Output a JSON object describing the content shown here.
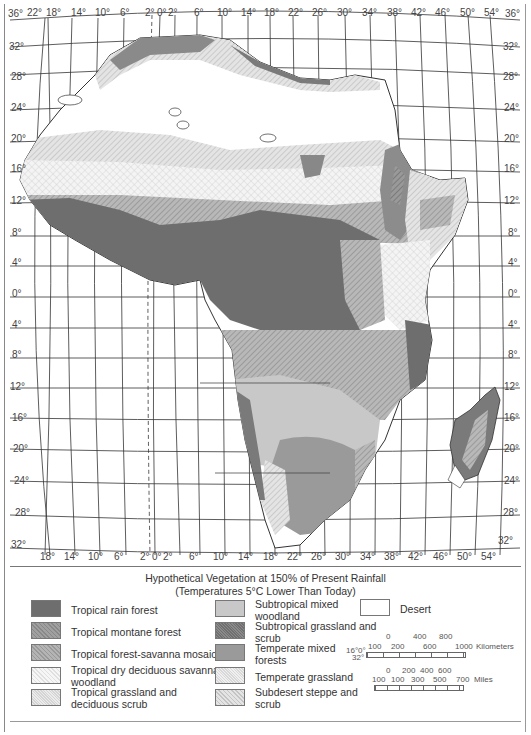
{
  "map": {
    "title": "Hypothetical Vegetation at 150% of Present Rainfall",
    "subtitle": "(Temperatures 5°C Lower Than Today)",
    "top_longitude_labels": [
      "22°",
      "18°",
      "14°",
      "10°",
      "6°",
      "2°",
      "0°",
      "2°",
      "6°",
      "10°",
      "14°",
      "18°",
      "22°",
      "26°",
      "30°",
      "34°",
      "38°",
      "42°",
      "46°",
      "50°",
      "54°"
    ],
    "bottom_longitude_labels": [
      "18°",
      "14°",
      "10°",
      "6°",
      "2°",
      "0°",
      "2°",
      "6°",
      "10°",
      "14°",
      "18°",
      "22°",
      "26°",
      "30°",
      "34°",
      "38°",
      "42°",
      "46°",
      "50°",
      "54°"
    ],
    "left_latitude_labels": [
      "36°",
      "32°",
      "28°",
      "24°",
      "20°",
      "16°",
      "12°",
      "8°",
      "4°",
      "0°",
      "4°",
      "8°",
      "12°",
      "16°",
      "20°",
      "24°",
      "28°",
      "32°"
    ],
    "right_latitude_labels": [
      "36°",
      "32°",
      "28°",
      "24°",
      "20°",
      "16°",
      "12°",
      "8°",
      "4°",
      "0°",
      "4°",
      "8°",
      "12°",
      "16°",
      "20°",
      "24°",
      "28°",
      "32°"
    ]
  },
  "legend": {
    "items": [
      {
        "label": "Tropical rain forest",
        "fill": "#6e6e6e",
        "pattern": "solid"
      },
      {
        "label": "Tropical montane forest",
        "fill": "#8c8c8c",
        "pattern": "hatch"
      },
      {
        "label": "Tropical forest-savanna mosaic",
        "fill": "#a8a8a8",
        "pattern": "hatch"
      },
      {
        "label": "Tropical dry deciduous savanna woodland",
        "fill": "#f2f2f2",
        "pattern": "cross"
      },
      {
        "label": "Tropical grassland and deciduous scrub",
        "fill": "#e6e6e6",
        "pattern": "fine"
      },
      {
        "label": "Subtropical mixed woodland",
        "fill": "#c8c8c8",
        "pattern": "solid"
      },
      {
        "label": "Subtropical grassland and scrub",
        "fill": "#7a7a7a",
        "pattern": "stipple"
      },
      {
        "label": "Temperate mixed forests",
        "fill": "#9a9a9a",
        "pattern": "solid"
      },
      {
        "label": "Temperate grassland",
        "fill": "#ececec",
        "pattern": "fine"
      },
      {
        "label": "Subdesert steppe and scrub",
        "fill": "#dedede",
        "pattern": "hatch"
      },
      {
        "label": "Desert",
        "fill": "#ffffff",
        "pattern": "none"
      }
    ],
    "scale_km": {
      "top": [
        "0",
        "400",
        "800"
      ],
      "bottom": [
        "100",
        "200",
        "600",
        "1000"
      ],
      "unit": "Kilometers",
      "left_note_1": "16°0°",
      "left_note_2": "32°"
    },
    "scale_miles": {
      "top": [
        "0",
        "200",
        "400",
        "600"
      ],
      "bottom": [
        "100",
        "100",
        "300",
        "500",
        "700"
      ],
      "unit": "Miles"
    }
  }
}
